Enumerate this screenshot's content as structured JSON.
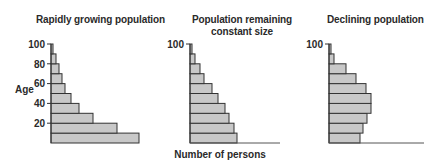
{
  "chart_data": [
    {
      "type": "bar",
      "orientation": "horizontal",
      "title": "Rapidly growing population",
      "ylabel": "Age",
      "xlabel": "Number of persons",
      "y_ticks": [
        20,
        40,
        60,
        80,
        100
      ],
      "ylim": [
        0,
        100
      ],
      "categories": [
        "0-10",
        "10-20",
        "20-30",
        "30-40",
        "40-50",
        "50-60",
        "60-70",
        "70-80",
        "80-90",
        "90-100"
      ],
      "values": [
        88,
        66,
        42,
        28,
        20,
        14,
        11,
        8,
        5,
        2
      ],
      "bar_color": "#c8c8c8",
      "edge_color": "#333333"
    },
    {
      "type": "bar",
      "orientation": "horizontal",
      "title": "Population remaining constant size",
      "ylabel": "",
      "xlabel": "Number of persons",
      "y_ticks": [
        100
      ],
      "ylim": [
        0,
        100
      ],
      "categories": [
        "0-10",
        "10-20",
        "20-30",
        "30-40",
        "40-50",
        "50-60",
        "60-70",
        "70-80",
        "80-90",
        "90-100"
      ],
      "values": [
        47,
        44,
        39,
        35,
        28,
        22,
        14,
        10,
        5,
        2
      ],
      "bar_color": "#c8c8c8",
      "edge_color": "#333333"
    },
    {
      "type": "bar",
      "orientation": "horizontal",
      "title": "Declining population",
      "ylabel": "",
      "xlabel": "",
      "y_ticks": [
        100
      ],
      "ylim": [
        0,
        100
      ],
      "categories": [
        "0-10",
        "10-20",
        "20-30",
        "30-40",
        "40-50",
        "50-60",
        "60-70",
        "70-80",
        "80-90",
        "90-100"
      ],
      "values": [
        31,
        34,
        38,
        42,
        42,
        37,
        27,
        17,
        5,
        2
      ],
      "bar_color": "#c8c8c8",
      "edge_color": "#333333"
    }
  ],
  "labels": {
    "title1": "Rapidly growing population",
    "title2_line1": "Population remaining",
    "title2_line2": "constant size",
    "title3": "Declining population",
    "age": "Age",
    "xlabel": "Number of persons",
    "t100a": "100",
    "t80": "80",
    "t60": "60",
    "t40": "40",
    "t20": "20",
    "t100b": "100",
    "t100c": "100"
  }
}
